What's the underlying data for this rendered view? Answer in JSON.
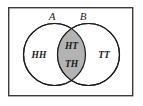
{
  "figure": {
    "type": "venn-diagram",
    "universe_frame": {
      "name": "sample-space-rectangle",
      "x": 8,
      "y": 7,
      "width": 125,
      "height": 89,
      "stroke": "#3a3a3a",
      "fill": "#ffffff",
      "stroke_width": 1.4
    },
    "background_color": "#ffffff",
    "sets": [
      {
        "id": "A",
        "label": "A",
        "label_x": 52,
        "label_y": 20,
        "circle": {
          "cx": 54.5,
          "cy": 54.5,
          "r": 31
        },
        "stroke": "#1a1a1a",
        "fill": "#ffffff"
      },
      {
        "id": "B",
        "label": "B",
        "label_x": 83,
        "label_y": 20,
        "circle": {
          "cx": 88.5,
          "cy": 54.5,
          "r": 31
        },
        "stroke": "#1a1a1a",
        "fill": "#ffffff"
      }
    ],
    "intersection": {
      "name": "intersection-lens",
      "fill": "#b3b3b3",
      "stroke": "#1a1a1a",
      "shaded": true
    },
    "regions": [
      {
        "id": "a-only",
        "name": "region-a-only",
        "label": "HH",
        "x": 39,
        "y": 58,
        "shaded": false
      },
      {
        "id": "a-and-b-top",
        "name": "region-intersection-top",
        "label": "HT",
        "x": 71.5,
        "y": 49,
        "shaded": true
      },
      {
        "id": "a-and-b-bottom",
        "name": "region-intersection-bottom",
        "label": "TH",
        "x": 71.5,
        "y": 67,
        "shaded": true
      },
      {
        "id": "b-only",
        "name": "region-b-only",
        "label": "TT",
        "x": 104,
        "y": 58,
        "shaded": false
      }
    ]
  }
}
